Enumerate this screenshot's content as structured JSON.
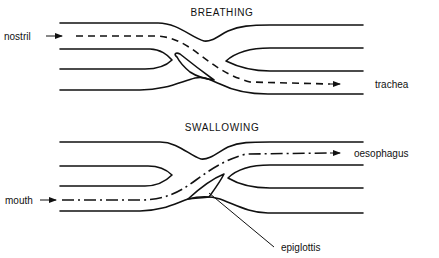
{
  "diagram": {
    "panels": [
      {
        "id": "breathing",
        "title": "BREATHING",
        "input_label": "nostril",
        "output_label": "trachea",
        "path_style": "dashed"
      },
      {
        "id": "swallowing",
        "title": "SWALLOWING",
        "input_label": "mouth",
        "output_label": "oesophagus",
        "path_style": "dash-dot",
        "callout_label": "epiglottis"
      }
    ],
    "colors": {
      "line": "#111111",
      "background": "#ffffff"
    }
  }
}
